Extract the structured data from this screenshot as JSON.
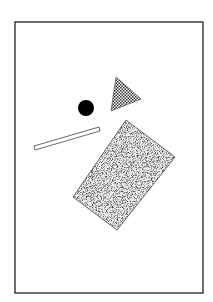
{
  "canvas": {
    "width": 213,
    "height": 302,
    "background": "#ffffff"
  },
  "frame": {
    "x": 15,
    "y": 22,
    "width": 188,
    "height": 271,
    "stroke": "#222222"
  },
  "shapes": {
    "circle": {
      "cx": 86,
      "cy": 108,
      "r": 8,
      "fill": "#000000",
      "label": "black-circle"
    },
    "triangle": {
      "points": "116,77 141,99 111,111",
      "fill": "checkerboard",
      "label": "checkered-triangle"
    },
    "bar": {
      "points": "34,146 99,127 100,131 35,150",
      "fill": "#ffffff",
      "label": "thin-bar"
    },
    "rectangle": {
      "points": "126,120 175,157 117,230 73,197",
      "fill": "stipple",
      "label": "stippled-rectangle"
    }
  }
}
